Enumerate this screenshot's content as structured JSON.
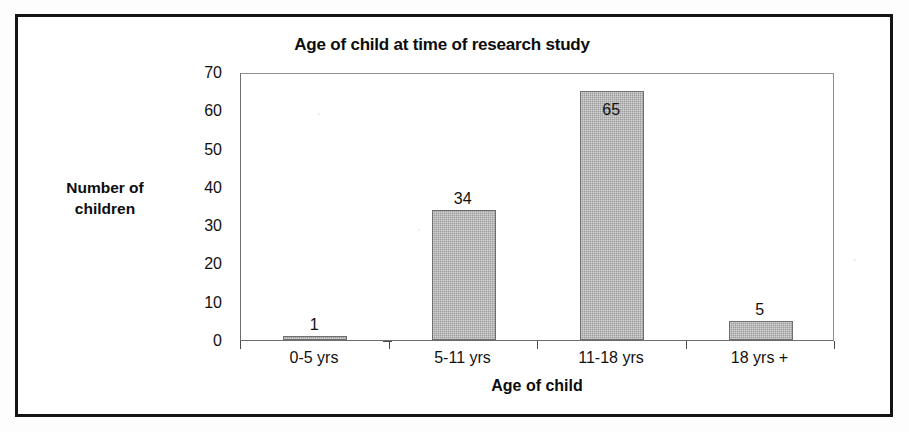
{
  "chart_data": {
    "type": "bar",
    "title": "Age of child at time of research study",
    "xlabel": "Age of child",
    "ylabel": "Number of children",
    "ylabel_line1": "Number of",
    "ylabel_line2": "children",
    "categories": [
      "0-5 yrs",
      "5-11 yrs",
      "11-18 yrs",
      "18 yrs +"
    ],
    "values": [
      1,
      34,
      65,
      5
    ],
    "value_labels": [
      "1",
      "34",
      "65",
      "5"
    ],
    "ylim": [
      0,
      70
    ],
    "ytick_labels": [
      "0",
      "10",
      "20",
      "30",
      "40",
      "50",
      "60",
      "70"
    ],
    "yticks": [
      0,
      10,
      20,
      30,
      40,
      50,
      60,
      70
    ],
    "grid": false,
    "legend": "none",
    "bar_color": "#9d9d9d",
    "bar_border_color": "#6f6f6f",
    "axis_color": "#4a4a4a",
    "text_color": "#111111",
    "background": "#ffffff",
    "frame_color": "#141414"
  }
}
